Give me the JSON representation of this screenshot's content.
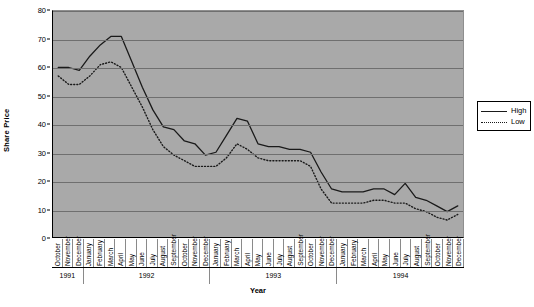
{
  "chart_data": {
    "type": "line",
    "title": "",
    "xlabel": "Year",
    "ylabel": "Share Price",
    "ylim": [
      0,
      80
    ],
    "yticks": [
      0,
      10,
      20,
      30,
      40,
      50,
      60,
      70,
      80
    ],
    "grid": true,
    "legend_position": "right",
    "categories": [
      "October",
      "November",
      "December",
      "January",
      "February",
      "March",
      "April",
      "May",
      "June",
      "July",
      "August",
      "September",
      "October",
      "November",
      "December",
      "January",
      "February",
      "March",
      "April",
      "May",
      "June",
      "July",
      "August",
      "September",
      "October",
      "November",
      "December",
      "January",
      "February",
      "March",
      "April",
      "May",
      "June",
      "July",
      "August",
      "September",
      "October",
      "November",
      "December"
    ],
    "year_groups": [
      {
        "label": "1991",
        "count": 3
      },
      {
        "label": "1992",
        "count": 12
      },
      {
        "label": "1993",
        "count": 12
      },
      {
        "label": "1994",
        "count": 12
      }
    ],
    "series": [
      {
        "name": "High",
        "style": "solid",
        "color": "#1a1a1a",
        "values": [
          60,
          60,
          59,
          64,
          68,
          71,
          71,
          62,
          53,
          45,
          39,
          38,
          34,
          33,
          29,
          30,
          36,
          42,
          41,
          33,
          32,
          32,
          31,
          31,
          30,
          23,
          17,
          16,
          16,
          16,
          17,
          17,
          15,
          19,
          14,
          13,
          11,
          9,
          11
        ]
      },
      {
        "name": "Low",
        "style": "dotted",
        "color": "#1a1a1a",
        "values": [
          57,
          54,
          54,
          57,
          61,
          62,
          60,
          53,
          46,
          38,
          32,
          29,
          27,
          25,
          25,
          25,
          28,
          33,
          31,
          28,
          27,
          27,
          27,
          27,
          25,
          17,
          12,
          12,
          12,
          12,
          13,
          13,
          12,
          12,
          10,
          9,
          7,
          6,
          8
        ]
      }
    ]
  },
  "legend": {
    "items": [
      {
        "label": "High"
      },
      {
        "label": "Low"
      }
    ]
  }
}
